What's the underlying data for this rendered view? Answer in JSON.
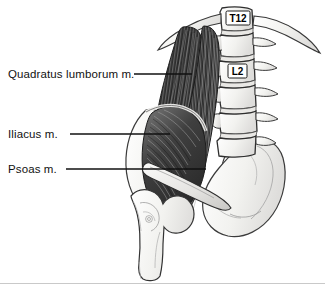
{
  "figure": {
    "view": "anterior view of left hemipelvis and lumbar spine",
    "background_color": "#ffffff",
    "line_color": "#111111",
    "muscle_dark": "#3a3a3a",
    "muscle_mid": "#6b6b6b",
    "bone_fill": "#f4f4f2",
    "footer_rule_color": "#c9c9c9"
  },
  "labels": {
    "quadratus": "Quadratus lumborum m.",
    "iliacus": "Iliacus m.",
    "psoas": "Psoas m."
  },
  "bone_tags": {
    "t12": "T12",
    "l2": "L2"
  },
  "leader_lines": [
    {
      "name": "quadratus-leader",
      "x1": 134,
      "y1": 74,
      "x2": 192,
      "y2": 74
    },
    {
      "name": "iliacus-leader",
      "x1": 70,
      "y1": 134,
      "x2": 170,
      "y2": 134
    },
    {
      "name": "psoas-leader",
      "x1": 66,
      "y1": 169,
      "x2": 206,
      "y2": 169
    }
  ],
  "structures": [
    {
      "name": "vertebral-column",
      "label": "Lumbar vertebrae T12-L5"
    },
    {
      "name": "twelfth-rib",
      "label": "12th rib"
    },
    {
      "name": "quadratus-lumborum",
      "label": "Quadratus lumborum muscle"
    },
    {
      "name": "psoas-major",
      "label": "Psoas major muscle"
    },
    {
      "name": "iliacus",
      "label": "Iliacus muscle"
    },
    {
      "name": "ilium",
      "label": "Ilium"
    },
    {
      "name": "sacrum",
      "label": "Sacrum"
    },
    {
      "name": "femur",
      "label": "Proximal femur"
    },
    {
      "name": "transverse-processes",
      "label": "Transverse processes"
    }
  ]
}
